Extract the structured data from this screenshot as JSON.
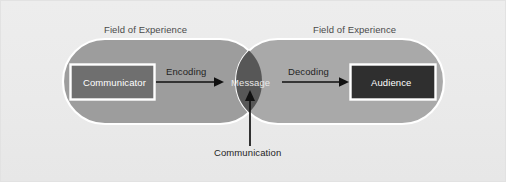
{
  "diagram": {
    "background_color": "#ececec",
    "fields": [
      {
        "id": "left",
        "label": "Field of Experience",
        "fill": "#9d9d9d",
        "stroke": "#ffffff"
      },
      {
        "id": "right",
        "label": "Field of Experience",
        "fill": "#a9a9a9",
        "stroke": "#ffffff"
      }
    ],
    "nodes": [
      {
        "id": "communicator",
        "label": "Communicator",
        "shape": "rectangle",
        "fill": "#6f6f6f",
        "stroke": "#ffffff",
        "text_color": "#ffffff"
      },
      {
        "id": "message",
        "label": "Message",
        "shape": "lens",
        "fill": "#575757",
        "stroke": "#ffffff",
        "text_color": "#e8e8e8"
      },
      {
        "id": "audience",
        "label": "Audience",
        "shape": "rectangle",
        "fill": "#2f2f2f",
        "stroke": "#ffffff",
        "text_color": "#ffffff"
      }
    ],
    "edges": [
      {
        "id": "encoding",
        "label": "Encoding",
        "from": "communicator",
        "to": "message",
        "direction": "right",
        "color": "#111111"
      },
      {
        "id": "decoding",
        "label": "Decoding",
        "from": "message",
        "to": "audience",
        "direction": "right",
        "color": "#111111"
      },
      {
        "id": "communication",
        "label": "Communication",
        "from": "caption",
        "to": "message",
        "direction": "up",
        "color": "#111111"
      }
    ],
    "accent_color": "#111111"
  }
}
